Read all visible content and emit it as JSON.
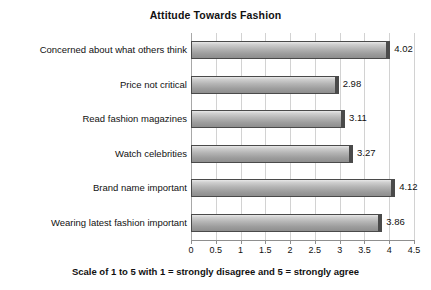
{
  "chart_data": {
    "type": "bar",
    "orientation": "horizontal",
    "title": "Attitude Towards Fashion",
    "caption": "Scale of 1 to 5 with 1 = strongly disagree and 5 = strongly agree",
    "xlabel": "",
    "ylabel": "",
    "xlim": [
      0,
      4.5
    ],
    "grid": true,
    "legend": "none",
    "tick_labels": [
      "0",
      "0.5",
      "1",
      "1.5",
      "2",
      "2.5",
      "3",
      "3.5",
      "4",
      "4.5"
    ],
    "tick_values": [
      0,
      0.5,
      1,
      1.5,
      2,
      2.5,
      3,
      3.5,
      4,
      4.5
    ],
    "categories": [
      "Concerned about what others think",
      "Price not critical",
      "Read fashion magazines",
      "Watch celebrities",
      "Brand name important",
      "Wearing latest fashion important"
    ],
    "values": [
      4.02,
      2.98,
      3.11,
      3.27,
      4.12,
      3.86
    ],
    "value_labels": [
      "4.02",
      "2.98",
      "3.11",
      "3.27",
      "4.12",
      "3.86"
    ],
    "colors": {
      "bar_fill_light": "#e8e8e8",
      "bar_fill_dark": "#8e8e8e",
      "bar_border": "#4a4a4a",
      "gridline": "#d2d2d2",
      "axis": "#8f8f8f",
      "text": "#111111",
      "background": "#ffffff"
    }
  }
}
